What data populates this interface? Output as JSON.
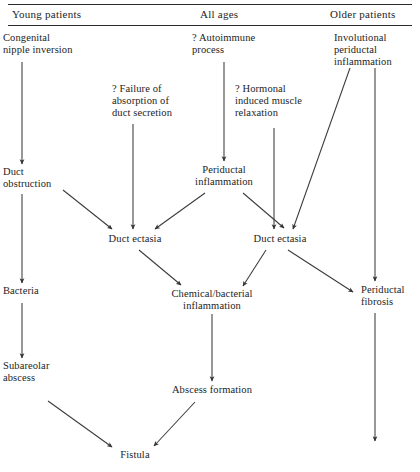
{
  "figure": {
    "type": "flowchart",
    "title": "",
    "columns": [
      {
        "id": "young",
        "label": "Young patients"
      },
      {
        "id": "all",
        "label": "All ages"
      },
      {
        "id": "older",
        "label": "Older patients"
      }
    ],
    "rules": [
      {
        "id": "top-rule"
      },
      {
        "id": "header-rule"
      }
    ],
    "nodes": [
      {
        "id": "congenital-nipple-inversion",
        "label": "Congenital\nnipple inversion",
        "column": "young"
      },
      {
        "id": "duct-obstruction",
        "label": "Duct\nobstruction",
        "column": "young"
      },
      {
        "id": "bacteria",
        "label": "Bacteria",
        "column": "young"
      },
      {
        "id": "subareolar-abscess",
        "label": "Subareolar\nabscess",
        "column": "young"
      },
      {
        "id": "failure-of-absorption",
        "label": "? Failure of\nabsorption of\nduct secretion",
        "column": "all"
      },
      {
        "id": "autoimmune-process",
        "label": "? Autoimmune\nprocess",
        "column": "all"
      },
      {
        "id": "hormonal-muscle-relaxation",
        "label": "? Hormonal\ninduced muscle\nrelaxation",
        "column": "all"
      },
      {
        "id": "periductal-inflammation",
        "label": "Periductal\ninflammation",
        "column": "all"
      },
      {
        "id": "duct-ectasia-left",
        "label": "Duct ectasia",
        "column": "all"
      },
      {
        "id": "duct-ectasia-right",
        "label": "Duct ectasia",
        "column": "all"
      },
      {
        "id": "chemical-bacterial-inflammation",
        "label": "Chemical/bacterial\ninflammation",
        "column": "all"
      },
      {
        "id": "abscess-formation",
        "label": "Abscess formation",
        "column": "all"
      },
      {
        "id": "fistula",
        "label": "Fistula",
        "column": "all"
      },
      {
        "id": "involutional-periductal-inflammation",
        "label": "Involutional\nperiductal\ninflammation",
        "column": "older"
      },
      {
        "id": "periductal-fibrosis",
        "label": "Periductal\nfibrosis",
        "column": "older"
      }
    ],
    "edges": [
      {
        "from": "congenital-nipple-inversion",
        "to": "duct-obstruction"
      },
      {
        "from": "duct-obstruction",
        "to": "bacteria"
      },
      {
        "from": "duct-obstruction",
        "to": "duct-ectasia-left"
      },
      {
        "from": "bacteria",
        "to": "subareolar-abscess"
      },
      {
        "from": "subareolar-abscess",
        "to": "fistula"
      },
      {
        "from": "failure-of-absorption",
        "to": "duct-ectasia-left"
      },
      {
        "from": "autoimmune-process",
        "to": "periductal-inflammation"
      },
      {
        "from": "periductal-inflammation",
        "to": "duct-ectasia-left"
      },
      {
        "from": "periductal-inflammation",
        "to": "duct-ectasia-right"
      },
      {
        "from": "hormonal-muscle-relaxation",
        "to": "duct-ectasia-right"
      },
      {
        "from": "involutional-periductal-inflammation",
        "to": "duct-ectasia-right"
      },
      {
        "from": "involutional-periductal-inflammation",
        "to": "periductal-fibrosis"
      },
      {
        "from": "duct-ectasia-left",
        "to": "chemical-bacterial-inflammation"
      },
      {
        "from": "duct-ectasia-right",
        "to": "chemical-bacterial-inflammation"
      },
      {
        "from": "duct-ectasia-right",
        "to": "periductal-fibrosis"
      },
      {
        "from": "chemical-bacterial-inflammation",
        "to": "abscess-formation"
      },
      {
        "from": "abscess-formation",
        "to": "fistula"
      },
      {
        "from": "periductal-fibrosis",
        "to": ""
      }
    ],
    "colors": {
      "ink": "#1d1d1d",
      "rule": "#2b2b2b",
      "arrow": "#3a3a3a",
      "background": "#ffffff"
    }
  }
}
